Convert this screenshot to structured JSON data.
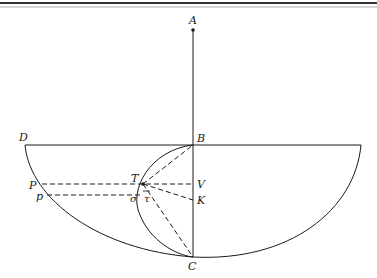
{
  "figure": {
    "type": "geometric-diagram",
    "labels": {
      "A": "A",
      "B": "B",
      "C": "C",
      "D": "D",
      "P": "P",
      "p": "p",
      "T": "T",
      "V": "V",
      "K": "K",
      "sigma": "σ",
      "tau": "τ"
    },
    "colors": {
      "ink": "#1a1a1a",
      "background": "#ffffff"
    }
  }
}
